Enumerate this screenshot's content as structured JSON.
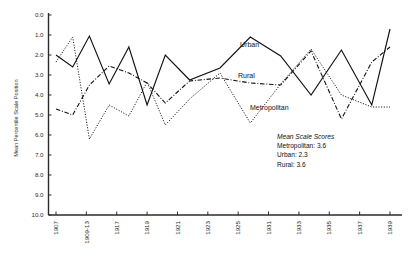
{
  "chart_data": {
    "type": "line",
    "title": "",
    "xlabel": "",
    "ylabel": "Mean Percentile Scale Position",
    "ylim": [
      0.0,
      10.0
    ],
    "y_inverted": true,
    "grid": false,
    "legend": "inline-labels",
    "categories": [
      "1907",
      "1909-13",
      "1917",
      "1919",
      "1921",
      "1923",
      "1925",
      "1931",
      "1933",
      "1935",
      "1937",
      "1939"
    ],
    "x_tick_labels": [
      "1907",
      "1909-13",
      "1917",
      "1919",
      "1921",
      "1923",
      "1925",
      "1931",
      "1933",
      "1935",
      "1937",
      "1939"
    ],
    "y_tick_labels": [
      "0.0",
      "1.0",
      "2.0",
      "3.0",
      "4.0",
      "5.0",
      "6.0",
      "7.0",
      "8.0",
      "9.0",
      "10.0"
    ],
    "y_tick_values": [
      0,
      1,
      2,
      3,
      4,
      5,
      6,
      7,
      8,
      9,
      10
    ],
    "x_points": [
      0,
      0.5,
      1,
      1.5,
      2,
      2.5,
      3,
      4,
      5,
      6,
      7,
      8,
      9,
      10,
      11
    ],
    "series": [
      {
        "name": "Urban",
        "style": "solid",
        "label_text": "Urban",
        "x": [
          0,
          0.55,
          1.1,
          1.75,
          2.4,
          3.0,
          3.6,
          4.4,
          5.4,
          6.4,
          7.4,
          8.4,
          9.4,
          10.4,
          11.0
        ],
        "values": [
          2.0,
          2.6,
          1.05,
          3.45,
          1.6,
          4.5,
          2.0,
          3.25,
          2.65,
          1.1,
          2.05,
          4.0,
          1.75,
          4.5,
          0.7
        ]
      },
      {
        "name": "Metropolitan",
        "style": "dotted",
        "label_text": "Metropolitan",
        "x": [
          0,
          0.55,
          1.1,
          1.75,
          2.4,
          3.0,
          3.6,
          4.4,
          5.4,
          6.4,
          7.4,
          8.4,
          9.4,
          10.4,
          11.0
        ],
        "values": [
          2.35,
          1.1,
          6.2,
          4.5,
          5.05,
          3.35,
          5.5,
          4.2,
          2.9,
          5.4,
          3.45,
          1.7,
          4.0,
          4.6,
          4.6
        ]
      },
      {
        "name": "Rural",
        "style": "dash-dot",
        "label_text": "Rural",
        "x": [
          0,
          0.55,
          1.1,
          1.75,
          2.4,
          3.0,
          3.6,
          4.4,
          5.4,
          6.4,
          7.4,
          8.4,
          9.4,
          10.4,
          11.0
        ],
        "values": [
          4.7,
          5.0,
          3.5,
          2.55,
          2.9,
          3.4,
          4.4,
          3.3,
          3.15,
          3.4,
          3.5,
          1.8,
          5.2,
          2.35,
          1.6
        ]
      }
    ],
    "annotations": {
      "note_title": "Mean Scale Scores",
      "note_lines": [
        "Metropolitan: 3.6",
        "Urban: 2.3",
        "Rural: 3.6"
      ]
    },
    "colors": {
      "line": "#111111",
      "axis": "#2b2b2b",
      "background": "#ffffff"
    }
  },
  "labels": {
    "y_axis_title": "Mean Percentile Scale Position",
    "urban": "Urban",
    "rural": "Rural",
    "metropolitan": "Metropolitan",
    "note_title": "Mean Scale Scores",
    "note_metropolitan": "Metropolitan: 3.6",
    "note_urban": "Urban: 2.3",
    "note_rural": "Rural: 3.6"
  },
  "y_ticks": [
    "0.0",
    "1.0",
    "2.0",
    "3.0",
    "4.0",
    "5.0",
    "6.0",
    "7.0",
    "8.0",
    "9.0",
    "10.0"
  ],
  "x_ticks": [
    "1907",
    "1909-13",
    "1917",
    "1919",
    "1921",
    "1923",
    "1925",
    "1931",
    "1933",
    "1935",
    "1937",
    "1939"
  ]
}
